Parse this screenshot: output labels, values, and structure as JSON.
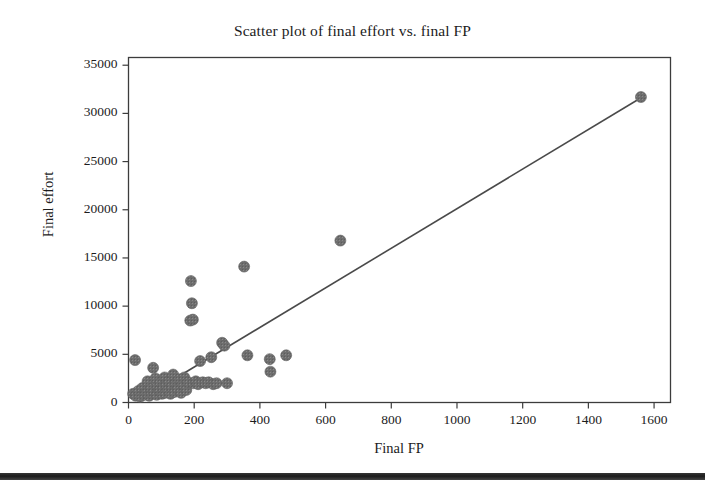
{
  "chart_data": {
    "type": "scatter",
    "title": "Scatter plot of final effort vs. final FP",
    "xlabel": "Final FP",
    "ylabel": "Final effort",
    "xlim": [
      0,
      1650
    ],
    "ylim": [
      0,
      35800
    ],
    "xticks": [
      0,
      200,
      400,
      600,
      800,
      1000,
      1200,
      1400,
      1600
    ],
    "xtick_labels": [
      "0",
      "200",
      "400",
      "600",
      "800",
      "1000",
      "1200",
      "1400",
      "1600"
    ],
    "yticks": [
      0,
      5000,
      10000,
      15000,
      20000,
      25000,
      30000,
      35000
    ],
    "ytick_labels": [
      "0",
      "5000",
      "10000",
      "15000",
      "20000",
      "25000",
      "30000",
      "35000"
    ],
    "grid": false,
    "legend": null,
    "marker_color": "#6b6b6b",
    "marker_size": 11,
    "line_color": "#4a4a4a",
    "frame_color": "#3c3c3c",
    "points": [
      [
        20,
        4400
      ],
      [
        14,
        900
      ],
      [
        22,
        700
      ],
      [
        30,
        1200
      ],
      [
        36,
        600
      ],
      [
        42,
        1500
      ],
      [
        48,
        800
      ],
      [
        55,
        1000
      ],
      [
        58,
        2200
      ],
      [
        63,
        700
      ],
      [
        68,
        1400
      ],
      [
        72,
        900
      ],
      [
        75,
        3600
      ],
      [
        78,
        1100
      ],
      [
        82,
        2500
      ],
      [
        86,
        800
      ],
      [
        90,
        1700
      ],
      [
        94,
        1200
      ],
      [
        98,
        2100
      ],
      [
        102,
        900
      ],
      [
        106,
        1500
      ],
      [
        110,
        2600
      ],
      [
        112,
        1000
      ],
      [
        116,
        1800
      ],
      [
        120,
        1300
      ],
      [
        124,
        2200
      ],
      [
        128,
        900
      ],
      [
        132,
        1600
      ],
      [
        136,
        2900
      ],
      [
        140,
        1100
      ],
      [
        145,
        2000
      ],
      [
        150,
        1400
      ],
      [
        155,
        2400
      ],
      [
        160,
        1000
      ],
      [
        165,
        1900
      ],
      [
        170,
        2600
      ],
      [
        176,
        1300
      ],
      [
        182,
        2100
      ],
      [
        188,
        8500
      ],
      [
        196,
        8600
      ],
      [
        193,
        10300
      ],
      [
        190,
        12600
      ],
      [
        198,
        2000
      ],
      [
        205,
        2200
      ],
      [
        212,
        1900
      ],
      [
        218,
        4300
      ],
      [
        226,
        2100
      ],
      [
        235,
        2000
      ],
      [
        244,
        2100
      ],
      [
        252,
        4700
      ],
      [
        258,
        1900
      ],
      [
        268,
        2000
      ],
      [
        285,
        6200
      ],
      [
        292,
        5900
      ],
      [
        300,
        2000
      ],
      [
        352,
        14100
      ],
      [
        362,
        4900
      ],
      [
        430,
        4500
      ],
      [
        432,
        3200
      ],
      [
        480,
        4900
      ],
      [
        645,
        16800
      ],
      [
        1560,
        31700
      ]
    ],
    "trendline": {
      "x": [
        55,
        1563
      ],
      "y": [
        700,
        31680
      ]
    }
  }
}
